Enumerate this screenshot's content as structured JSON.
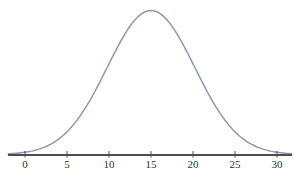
{
  "chart_data": {
    "type": "line",
    "title": "",
    "xlabel": "",
    "ylabel": "",
    "grid": false,
    "legend": "none",
    "x_ticks": [
      0,
      5,
      10,
      15,
      20,
      25,
      30
    ],
    "tick_labels": [
      "0",
      "5",
      "10",
      "15",
      "20",
      "25",
      "30"
    ],
    "xlim": [
      -2,
      31.8
    ],
    "ylim": [
      0,
      1.05
    ],
    "series": [
      {
        "name": "normal-distribution-curve",
        "distribution": "normal",
        "mean": 15,
        "sd": 5.2,
        "peak": 1.0,
        "points": [
          [
            0,
            0.0156
          ],
          [
            1,
            0.0266
          ],
          [
            2,
            0.0439
          ],
          [
            3,
            0.0699
          ],
          [
            4,
            0.1068
          ],
          [
            5,
            0.1574
          ],
          [
            6,
            0.2236
          ],
          [
            7,
            0.3063
          ],
          [
            8,
            0.4041
          ],
          [
            9,
            0.5139
          ],
          [
            10,
            0.6298
          ],
          [
            11,
            0.7439
          ],
          [
            12,
            0.8467
          ],
          [
            13,
            0.9287
          ],
          [
            14,
            0.9817
          ],
          [
            15,
            1.0
          ],
          [
            16,
            0.9817
          ],
          [
            17,
            0.9287
          ],
          [
            18,
            0.8467
          ],
          [
            19,
            0.7439
          ],
          [
            20,
            0.6298
          ],
          [
            21,
            0.5139
          ],
          [
            22,
            0.4041
          ],
          [
            23,
            0.3063
          ],
          [
            24,
            0.2236
          ],
          [
            25,
            0.1574
          ],
          [
            26,
            0.1068
          ],
          [
            27,
            0.0699
          ],
          [
            28,
            0.0439
          ],
          [
            29,
            0.0266
          ],
          [
            30,
            0.0156
          ]
        ]
      }
    ],
    "colors": {
      "curve": "#8e97b4",
      "axis": "#4d4d4d",
      "tick": "#4d4d4d",
      "tick_label": "#2e2e2e",
      "background": "#ffffff"
    }
  }
}
